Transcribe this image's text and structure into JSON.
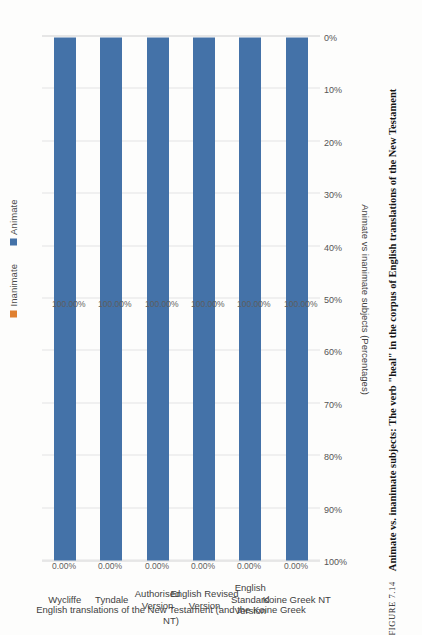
{
  "figure": {
    "number_label": "FIGURE 7.14",
    "caption": "Animate vs. inanimate subjects: The verb \"heal\" in the corpus of English translations of the New Testament"
  },
  "legend": {
    "position": "top-right",
    "items": [
      {
        "label": "Inanimate",
        "color": "#e08030"
      },
      {
        "label": "Animate",
        "color": "#4472a8"
      }
    ]
  },
  "axes": {
    "value_axis_title": "Animate vs inanimate subjects (Percentages)",
    "category_axis_title": "English translations of the New Testament (and the Koine Greek NT)",
    "value_ticks": [
      "100%",
      "90%",
      "80%",
      "70%",
      "60%",
      "50%",
      "40%",
      "30%",
      "20%",
      "10%",
      "0%"
    ]
  },
  "chart_data": {
    "type": "bar",
    "orientation": "horizontal-stacked",
    "title": "Animate vs. inanimate subjects: The verb \"heal\" in the corpus of English translations of the New Testament",
    "xlabel": "Animate vs inanimate subjects (Percentages)",
    "ylabel": "English translations of the New Testament (and the Koine Greek NT)",
    "ylim": [
      0,
      100
    ],
    "grid": true,
    "legend_position": "top-right",
    "categories": [
      "Wycliffe",
      "Tyndale",
      "Authorised\nVersion",
      "English Revised\nVersion",
      "English Standard\nVersion",
      "Koine Greek NT"
    ],
    "series": [
      {
        "name": "Animate",
        "color": "#4472a8",
        "values": [
          100.0,
          100.0,
          100.0,
          100.0,
          100.0,
          100.0
        ],
        "labels": [
          "100.00%",
          "100.00%",
          "100.00%",
          "100.00%",
          "100.00%",
          "100.00%"
        ]
      },
      {
        "name": "Inanimate",
        "color": "#e08030",
        "values": [
          0.0,
          0.0,
          0.0,
          0.0,
          0.0,
          0.0
        ],
        "labels": [
          "0.00%",
          "0.00%",
          "0.00%",
          "0.00%",
          "0.00%",
          "0.00%"
        ]
      }
    ]
  }
}
